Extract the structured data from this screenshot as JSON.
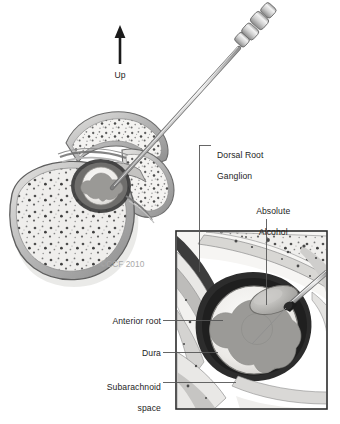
{
  "figure": {
    "copyright": "©CCF 2010",
    "orientation": {
      "arrow_icon": "up-arrow-icon",
      "label": "Up"
    },
    "labels": [
      {
        "id": "dorsal-root-ganglion",
        "text": "Dorsal Root\nGanglion",
        "line1": "Dorsal Root",
        "line2": "Ganglion"
      },
      {
        "id": "absolute-alcohol",
        "text": "Absolute\nAlcohol",
        "line1": "Absolute",
        "line2": "Alcohol"
      },
      {
        "id": "anterior-root",
        "text": "Anterior root"
      },
      {
        "id": "dura",
        "text": "Dura"
      },
      {
        "id": "subarachnoid-space",
        "text": "Subarachnoid\nspace",
        "line1": "Subarachnoid",
        "line2": "space"
      }
    ],
    "colors": {
      "ink": "#1d1d1d",
      "leader": "#555555",
      "copyright": "#a9a9a9",
      "bone_fill": "#f2f1ef",
      "bone_outline": "#6e6e6e",
      "cortex": "#b9b9b9",
      "dura_dark": "#2f2f2f",
      "gray_matter": "#9a9a9a",
      "cord_fill": "#f0efed",
      "needle_steel": "#c9c9c9",
      "needle_dark": "#5a5a5a",
      "inset_border": "#2b2b2b",
      "background": "#ffffff"
    },
    "inset": {
      "name": "magnified-detail-inset",
      "x": 176,
      "y": 231,
      "width": 151,
      "height": 178
    }
  }
}
